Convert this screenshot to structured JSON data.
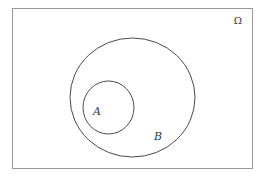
{
  "diagram": {
    "type": "venn",
    "universe": {
      "label": "Ω",
      "rect": {
        "x": 12,
        "y": 8,
        "width": 240,
        "height": 160
      },
      "stroke": "#9a9a9a"
    },
    "sets": [
      {
        "name": "B",
        "label": "B",
        "cx": 132.5,
        "cy": 97.5,
        "rx": 62.5,
        "ry": 59.5,
        "label_pos": {
          "x": 158,
          "y": 140
        },
        "stroke": "#4a4a4a"
      },
      {
        "name": "A",
        "label": "A",
        "cx": 108.5,
        "cy": 107.5,
        "rx": 25.5,
        "ry": 26.5,
        "label_pos": {
          "x": 96,
          "y": 115
        },
        "stroke": "#4a4a4a"
      }
    ],
    "relation": "A ⊂ B ⊂ Ω"
  }
}
